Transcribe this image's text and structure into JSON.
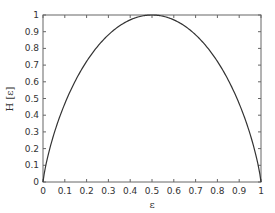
{
  "chart_data": {
    "type": "line",
    "title": "",
    "xlabel": "ε",
    "ylabel": "H [ε]",
    "xlim": [
      0,
      1
    ],
    "ylim": [
      0,
      1
    ],
    "grid": false,
    "legend": null,
    "xticks": [
      "0",
      "0.1",
      "0.2",
      "0.3",
      "0.4",
      "0.5",
      "0.6",
      "0.7",
      "0.8",
      "0.9",
      "1"
    ],
    "yticks": [
      "0",
      "0.1",
      "0.2",
      "0.3",
      "0.4",
      "0.5",
      "0.6",
      "0.7",
      "0.8",
      "0.9",
      "1"
    ],
    "series": [
      {
        "name": "H(ε) binary entropy",
        "color": "#333333",
        "x": [
          0,
          0.01,
          0.05,
          0.1,
          0.15,
          0.2,
          0.25,
          0.3,
          0.35,
          0.4,
          0.45,
          0.5,
          0.55,
          0.6,
          0.65,
          0.7,
          0.75,
          0.8,
          0.85,
          0.9,
          0.95,
          0.99,
          1
        ],
        "y": [
          0,
          0.081,
          0.286,
          0.469,
          0.61,
          0.722,
          0.811,
          0.881,
          0.934,
          0.971,
          0.993,
          1.0,
          0.993,
          0.971,
          0.934,
          0.881,
          0.811,
          0.722,
          0.61,
          0.469,
          0.286,
          0.081,
          0
        ]
      }
    ]
  },
  "colors": {
    "axis": "#666666",
    "line": "#333333",
    "text": "#333333"
  }
}
